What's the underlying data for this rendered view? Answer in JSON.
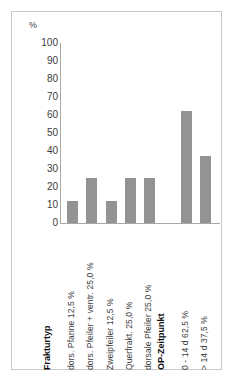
{
  "chart_data": {
    "type": "bar",
    "title": "",
    "xlabel": "",
    "ylabel": "%",
    "ylim": [
      0,
      100
    ],
    "ytick_labels": [
      "100",
      "90",
      "80",
      "70",
      "60",
      "50",
      "40",
      "30",
      "20",
      "10",
      "0"
    ],
    "ytick_values": [
      100,
      90,
      80,
      70,
      60,
      50,
      40,
      30,
      20,
      10,
      0
    ],
    "grid": false,
    "legend": "none",
    "groups": [
      {
        "name": "Frakturtyp",
        "categories": [
          "dors. Pfanne  12,5 %",
          "dors. Pfeiler + ventr.  25,0 %",
          "Zweipfeiler  12,5 %",
          "Querfrakt.  25,0 %",
          "dorsale Pfeiler  25,0 %"
        ],
        "values": [
          12.5,
          25.0,
          12.5,
          25.0,
          25.0
        ]
      },
      {
        "name": "OP-Zeitpunkt",
        "categories": [
          "0 - 14 d  62,5 %",
          "> 14 d  37,5 %"
        ],
        "values": [
          62.5,
          37.5
        ]
      }
    ],
    "bar_color": "#939393",
    "axis_color": "#a8a8a8",
    "frame_color": "#c8c8c8",
    "text_color": "#3c3c3c"
  }
}
